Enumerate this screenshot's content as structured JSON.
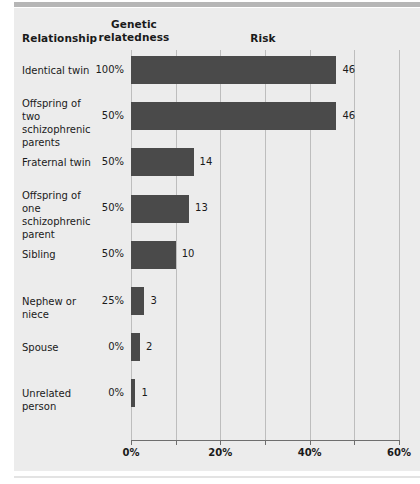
{
  "header": {
    "col_relationship": "Relationship",
    "col_genetic_line1": "Genetic",
    "col_genetic_line2": "relatedness",
    "col_risk": "Risk"
  },
  "chart_data": {
    "type": "bar",
    "orientation": "horizontal",
    "title": "Risk",
    "xlabel": "",
    "ylabel": "Relationship",
    "xlim": [
      0,
      60
    ],
    "x_unit": "%",
    "grid": true,
    "gridline_values": [
      0,
      10,
      20,
      30,
      40,
      50,
      60
    ],
    "tick_values": [
      0,
      10,
      20,
      30,
      40,
      50,
      60
    ],
    "tick_labels": [
      "0%",
      "",
      "20%",
      "",
      "40%",
      "",
      "60%"
    ],
    "axis_labels_shown": [
      "0%",
      "20%",
      "40%",
      "60%"
    ],
    "legend": null,
    "bar_color": "#4a4a4a",
    "background_color": "#ececec",
    "categories": [
      "Identical twin",
      "Offspring of two schizophrenic parents",
      "Fraternal twin",
      "Offspring of one schizophrenic parent",
      "Sibling",
      "Nephew or niece",
      "Spouse",
      "Unrelated person"
    ],
    "values": [
      46,
      46,
      14,
      13,
      10,
      3,
      2,
      1
    ],
    "value_labels": [
      "46",
      "46",
      "14",
      "13",
      "10",
      "3",
      "2",
      "1"
    ],
    "secondary_series": {
      "name": "Genetic relatedness",
      "values": [
        "100%",
        "50%",
        "50%",
        "50%",
        "50%",
        "25%",
        "0%",
        "0%"
      ]
    }
  },
  "rows": [
    {
      "label_lines": [
        "Identical twin"
      ],
      "genetic": "100%",
      "risk": 46,
      "risk_label": "46"
    },
    {
      "label_lines": [
        "Offspring of two",
        "schizophrenic",
        "parents"
      ],
      "genetic": "50%",
      "risk": 46,
      "risk_label": "46"
    },
    {
      "label_lines": [
        "Fraternal twin"
      ],
      "genetic": "50%",
      "risk": 14,
      "risk_label": "14"
    },
    {
      "label_lines": [
        "Offspring of one",
        "schizophrenic",
        "parent"
      ],
      "genetic": "50%",
      "risk": 13,
      "risk_label": "13"
    },
    {
      "label_lines": [
        "Sibling"
      ],
      "genetic": "50%",
      "risk": 10,
      "risk_label": "10"
    },
    {
      "label_lines": [
        "Nephew or niece"
      ],
      "genetic": "25%",
      "risk": 3,
      "risk_label": "3"
    },
    {
      "label_lines": [
        "Spouse"
      ],
      "genetic": "0%",
      "risk": 2,
      "risk_label": "2"
    },
    {
      "label_lines": [
        "Unrelated person"
      ],
      "genetic": "0%",
      "risk": 1,
      "risk_label": "1"
    }
  ]
}
